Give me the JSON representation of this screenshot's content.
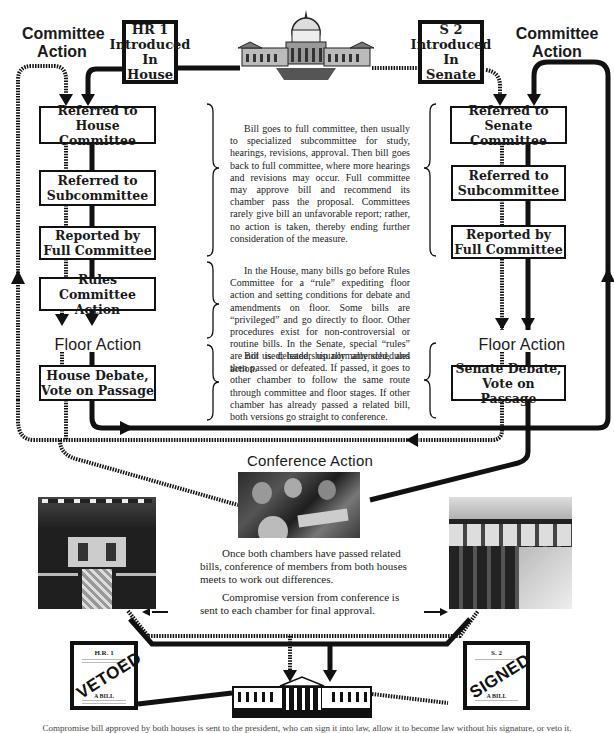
{
  "headings": {
    "committee_action_left": "Committee Action",
    "committee_action_right": "Committee Action",
    "floor_action_left": "Floor Action",
    "floor_action_right": "Floor Action",
    "conference_action": "Conference Action"
  },
  "intro": {
    "house": {
      "line1": "HR 1",
      "line2": "Introduced",
      "line3": "In House"
    },
    "senate": {
      "line1": "S 2",
      "line2": "Introduced",
      "line3": "In Senate"
    }
  },
  "house_steps": [
    {
      "line1": "Referred to",
      "line2": "House Committee"
    },
    {
      "line1": "Referred to",
      "line2": "Subcommittee"
    },
    {
      "line1": "Reported by",
      "line2": "Full Committee"
    },
    {
      "line1": "Rules Committee",
      "line2": "Action"
    },
    {
      "line1": "House Debate,",
      "line2": "Vote on Passage"
    }
  ],
  "senate_steps": [
    {
      "line1": "Referred to",
      "line2": "Senate Committee"
    },
    {
      "line1": "Referred to",
      "line2": "Subcommittee"
    },
    {
      "line1": "Reported by",
      "line2": "Full Committee"
    },
    {
      "line1": "Senate Debate,",
      "line2": "Vote on Passage"
    }
  ],
  "descriptions": {
    "committee": "Bill goes to full committee, then usually to specialized subcommittee for study, hearings, revisions, approval. Then bill goes back to full committee, where more hearings and revisions may occur. Full committee may approve bill and recommend its chamber pass the proposal. Committees rarely give bill an unfavorable report; rather, no action is taken, thereby ending further consideration of the measure.",
    "rules": "In the House, many bills go before Rules Committee for a “rule” expediting floor action and setting conditions for debate and amendments on floor. Some bills are “privileged” and go directly to floor. Other procedures exist for non-controversial or routine bills. In the Senate, special “rules” are not used; leadership normally schedules action.",
    "floor": "Bill is debated, usually amended, and then passed or defeated. If passed, it goes to other chamber to follow the same route through committee and floor stages. If other chamber has already passed a related bill, both versions go straight to conference."
  },
  "conference": {
    "text1": "Once both chambers have passed related bills, conference of members from both houses meets to work out differences.",
    "text2": "Compromise version from conference is sent to each chamber for final approval."
  },
  "documents": {
    "house_bill": {
      "number": "H.R. 1",
      "stamp": "VETOED",
      "subtitle": "A BILL"
    },
    "senate_bill": {
      "number": "S. 2",
      "stamp": "SIGNED",
      "subtitle": "A BILL"
    }
  },
  "caption": "Compromise bill approved by both houses is sent to the president, who can sign it into law, allow it to become law without his signature, or veto it.",
  "colors": {
    "ink": "#111111",
    "paper": "#ffffff",
    "text": "#222222"
  }
}
